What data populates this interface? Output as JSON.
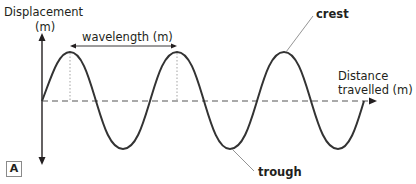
{
  "labels": {
    "y_axis_line1": "Displacement",
    "y_axis_line2": "(m)",
    "wavelength": "wavelength (m)",
    "crest": "crest",
    "trough": "trough",
    "x_axis_line1": "Distance",
    "x_axis_line2": "travelled (m)",
    "figure_tag": "A"
  },
  "colors": {
    "wave": "#333333",
    "axis": "#231f20",
    "dashed_baseline": "#555555",
    "leader_line": "#888888",
    "dotted_guides": "#999999"
  },
  "diagram": {
    "type": "transverse wave",
    "cycles": 3,
    "annotations": [
      "crest",
      "trough",
      "wavelength (m)"
    ]
  }
}
